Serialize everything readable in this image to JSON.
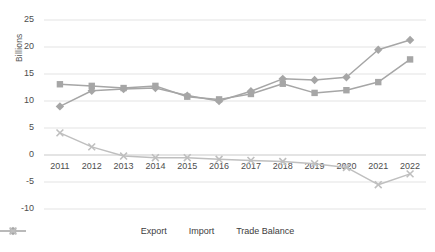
{
  "chart_data": {
    "type": "line",
    "title": "",
    "xlabel": "",
    "ylabel": "Billions",
    "ylim": [
      -10,
      25
    ],
    "yticks": [
      25,
      20,
      15,
      10,
      5,
      0,
      -5,
      -10
    ],
    "ytick_labels": [
      "25",
      "20",
      "15",
      "10",
      "5",
      "0",
      "-5",
      "-10"
    ],
    "grid": true,
    "grid_axis": "y",
    "legend_position": "bottom",
    "categories": [
      "2011",
      "2012",
      "2013",
      "2014",
      "2015",
      "2016",
      "2017",
      "2018",
      "2019",
      "2020",
      "2021",
      "2022"
    ],
    "series": [
      {
        "name": "Export",
        "marker": "square",
        "color": "#a6a6a6",
        "values": [
          13.1,
          12.8,
          12.4,
          12.8,
          10.8,
          10.3,
          11.3,
          13.2,
          11.5,
          12.0,
          13.5,
          17.7
        ]
      },
      {
        "name": "Import",
        "marker": "diamond",
        "color": "#a6a6a6",
        "values": [
          9.0,
          11.9,
          12.2,
          12.4,
          11.0,
          10.0,
          11.8,
          14.1,
          13.9,
          14.4,
          19.5,
          21.3
        ]
      },
      {
        "name": "Trade Balance",
        "marker": "x",
        "color": "#bfbfbf",
        "values": [
          4.1,
          1.5,
          -0.2,
          -0.5,
          -0.5,
          -0.8,
          -1.0,
          -1.2,
          -1.6,
          -2.3,
          -5.5,
          -3.5
        ]
      }
    ]
  },
  "legend": {
    "items": [
      {
        "label": "Export"
      },
      {
        "label": "Import"
      },
      {
        "label": "Trade Balance"
      }
    ]
  },
  "yaxis": {
    "title": "Billions"
  }
}
